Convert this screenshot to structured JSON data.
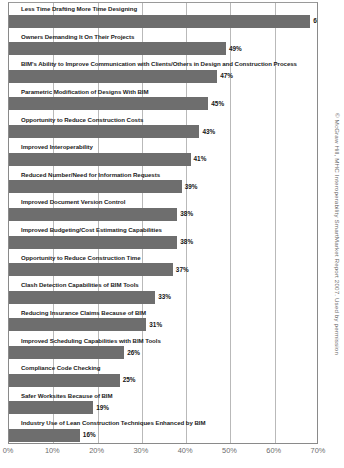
{
  "chart_data": {
    "type": "bar",
    "orientation": "horizontal",
    "title": "",
    "xlabel": "",
    "ylabel": "",
    "xlim": [
      0,
      70
    ],
    "grid": true,
    "legend": null,
    "tick_labels": [
      "0%",
      "10%",
      "20%",
      "30%",
      "40%",
      "50%",
      "60%",
      "70%"
    ],
    "tick_values": [
      0,
      10,
      20,
      30,
      40,
      50,
      60,
      70
    ],
    "value_suffix": "%",
    "bar_color": "#6e6e6e",
    "categories": [
      "Less Time Drafting More Time Designing",
      "Owners Demanding It On Their Projects",
      "BIM's Ability to Improve Communication with Clients/Others in Design and Construction Process",
      "Parametric Modification of Designs With BIM",
      "Opportunity to Reduce Construction Costs",
      "Improved Interoperability",
      "Reduced Number/Need for Information Requests",
      "Improved Document Version Control",
      "Improved Budgeting/Cost Estimating Capabilities",
      "Opportunity to Reduce Construction Time",
      "Clash Detection Capabilities of BIM Tools",
      "Reducing Insurance Claims Because of BIM",
      "Improved Scheduling Capabilities with BIM Tools",
      "Compliance Code Checking",
      "Safer Worksites Because of BIM",
      "Industry Use of Lean Construction Techniques Enhanced by BIM"
    ],
    "values": [
      68,
      49,
      47,
      45,
      43,
      41,
      39,
      38,
      38,
      37,
      33,
      31,
      26,
      25,
      19,
      16
    ],
    "value_labels": [
      "68%",
      "49%",
      "47%",
      "45%",
      "43%",
      "41%",
      "39%",
      "38%",
      "38%",
      "37%",
      "33%",
      "31%",
      "26%",
      "25%",
      "19%",
      "16%"
    ]
  },
  "credit": {
    "text": "© McGraw Hill, MHC Interoperability SmartMarket Report 2007. Used by permission"
  }
}
